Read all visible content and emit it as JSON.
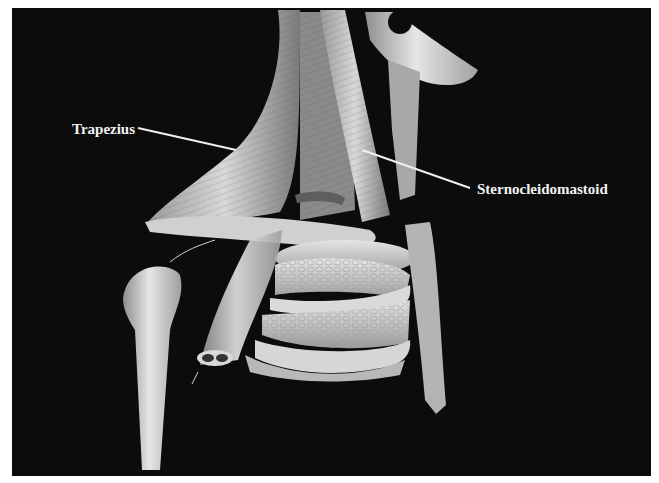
{
  "figure": {
    "background_color": "#0c0c0c",
    "labels": [
      {
        "text": "Trapezius",
        "x": 72,
        "y": 121,
        "line": [
          138,
          128,
          236,
          150
        ]
      },
      {
        "text": "Sternocleidomastoid",
        "x": 477,
        "y": 181,
        "line": [
          362,
          150,
          470,
          188
        ]
      }
    ]
  }
}
